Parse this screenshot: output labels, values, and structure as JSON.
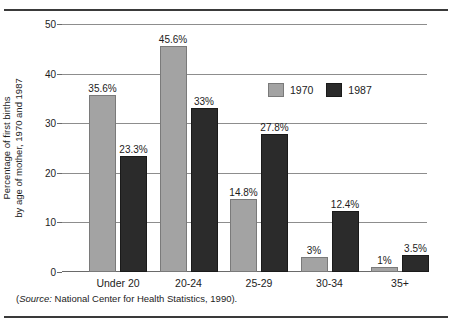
{
  "chart_data": {
    "type": "bar",
    "title": "",
    "xlabel": "",
    "ylabel_line1": "Percentage of first births",
    "ylabel_line2": "by age of mother, 1970 and 1987",
    "categories": [
      "Under 20",
      "20-24",
      "25-29",
      "30-34",
      "35+"
    ],
    "series": [
      {
        "name": "1970",
        "color": "#a3a3a3",
        "values": [
          35.6,
          45.6,
          14.8,
          3,
          1
        ],
        "labels": [
          "35.6%",
          "45.6%",
          "14.8%",
          "3%",
          "1%"
        ]
      },
      {
        "name": "1987",
        "color": "#2b2b2b",
        "values": [
          23.3,
          33,
          27.8,
          12.4,
          3.5
        ],
        "labels": [
          "23.3%",
          "33%",
          "27.8%",
          "12.4%",
          "3.5%"
        ]
      }
    ],
    "ylim": [
      0,
      50
    ],
    "yticks": [
      0,
      10,
      20,
      30,
      40,
      50
    ],
    "ytick_labels": [
      "0",
      "10",
      "20",
      "30",
      "40",
      "50"
    ],
    "grid": true,
    "legend_position": "upper-right-inside"
  },
  "legend": {
    "items": [
      {
        "label": "1970"
      },
      {
        "label": "1987"
      }
    ]
  },
  "source": {
    "open_paren": "(",
    "italic_word": "Source:",
    "rest": " National Center for Health Statistics, 1990)."
  }
}
